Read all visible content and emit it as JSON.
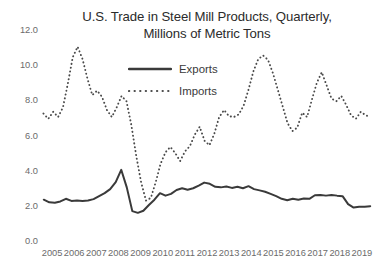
{
  "chart_data": {
    "type": "line",
    "title": "U.S. Trade in Steel Mill Products, Quarterly, Millions of Metric Tons",
    "title_lines": [
      "U.S. Trade in Steel Mill Products, Quarterly,",
      "Millions of Metric Tons"
    ],
    "xlabel": "",
    "ylabel": "",
    "ylim": [
      0.0,
      12.0
    ],
    "ytick_step": 2.0,
    "ytick_labels": [
      "0.0",
      "2.0",
      "4.0",
      "6.0",
      "8.0",
      "10.0",
      "12.0"
    ],
    "ytick_values": [
      0.0,
      2.0,
      4.0,
      6.0,
      8.0,
      10.0,
      12.0
    ],
    "xtick_labels": [
      "2005",
      "2006",
      "2007",
      "2008",
      "2009",
      "2010",
      "2011",
      "2012",
      "2013",
      "2014",
      "2015",
      "2016",
      "2017",
      "2018",
      "2019"
    ],
    "x_unit": "quarter",
    "x_start": "2005 Q1",
    "x_end": "2019 Q4",
    "grid": false,
    "legend_position": "upper center inside",
    "legend": [
      "Exports",
      "Imports"
    ],
    "colors": {
      "exports_line": "#3a3a3a",
      "imports_line": "#4a4a4a",
      "background": "#ffffff",
      "text": "#3a3a3a",
      "tick_text": "#6b6b6b"
    },
    "series": [
      {
        "name": "Exports",
        "style": "solid",
        "values": [
          2.35,
          2.2,
          2.18,
          2.25,
          2.4,
          2.28,
          2.3,
          2.28,
          2.3,
          2.38,
          2.55,
          2.72,
          2.95,
          3.35,
          4.05,
          3.05,
          1.7,
          1.6,
          1.72,
          2.05,
          2.35,
          2.72,
          2.58,
          2.68,
          2.9,
          3.0,
          2.92,
          3.0,
          3.15,
          3.32,
          3.25,
          3.08,
          3.05,
          3.1,
          3.02,
          3.08,
          3.0,
          3.12,
          2.95,
          2.88,
          2.8,
          2.68,
          2.55,
          2.4,
          2.32,
          2.4,
          2.35,
          2.42,
          2.4,
          2.6,
          2.62,
          2.58,
          2.62,
          2.58,
          2.55,
          2.1,
          1.9,
          1.95,
          1.95,
          1.98
        ]
      },
      {
        "name": "Imports",
        "style": "dotted",
        "values": [
          7.25,
          6.95,
          7.35,
          7.05,
          7.6,
          8.95,
          10.45,
          11.05,
          10.35,
          9.25,
          8.3,
          8.55,
          8.2,
          7.45,
          7.05,
          7.6,
          8.25,
          7.95,
          6.6,
          4.85,
          3.35,
          2.3,
          2.45,
          3.35,
          4.4,
          5.05,
          5.35,
          5.0,
          4.55,
          5.1,
          5.4,
          6.05,
          6.5,
          5.7,
          5.45,
          6.1,
          7.05,
          7.45,
          7.1,
          7.05,
          7.2,
          7.7,
          8.6,
          9.65,
          10.35,
          10.55,
          10.3,
          9.55,
          8.6,
          7.65,
          6.7,
          6.25,
          6.45,
          7.3,
          7.05,
          8.05,
          9.0,
          9.6,
          8.85,
          8.1,
          7.95,
          8.25,
          7.75,
          7.15,
          6.95,
          7.35,
          7.15,
          7.05
        ]
      }
    ],
    "notes": {
      "exports_peak": {
        "label": "2008 Q3 spike",
        "value": 4.05
      },
      "exports_trough": {
        "label": "2009 Q2 trough",
        "value": 1.6
      },
      "imports_peak": {
        "label": "2006 Q4 peak",
        "value": 11.05
      },
      "imports_trough": {
        "label": "2009 Q2 trough",
        "value": 2.3
      }
    }
  }
}
